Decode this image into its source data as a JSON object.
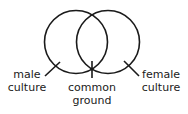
{
  "diagram": {
    "type": "venn",
    "circles": [
      {
        "id": "male",
        "label_line1": "male",
        "label_line2": "culture"
      },
      {
        "id": "female",
        "label_line1": "female",
        "label_line2": "culture"
      }
    ],
    "intersection": {
      "label_line1": "common",
      "label_line2": "ground"
    },
    "stroke_color": "#1a1a1a",
    "background": "#ffffff"
  }
}
